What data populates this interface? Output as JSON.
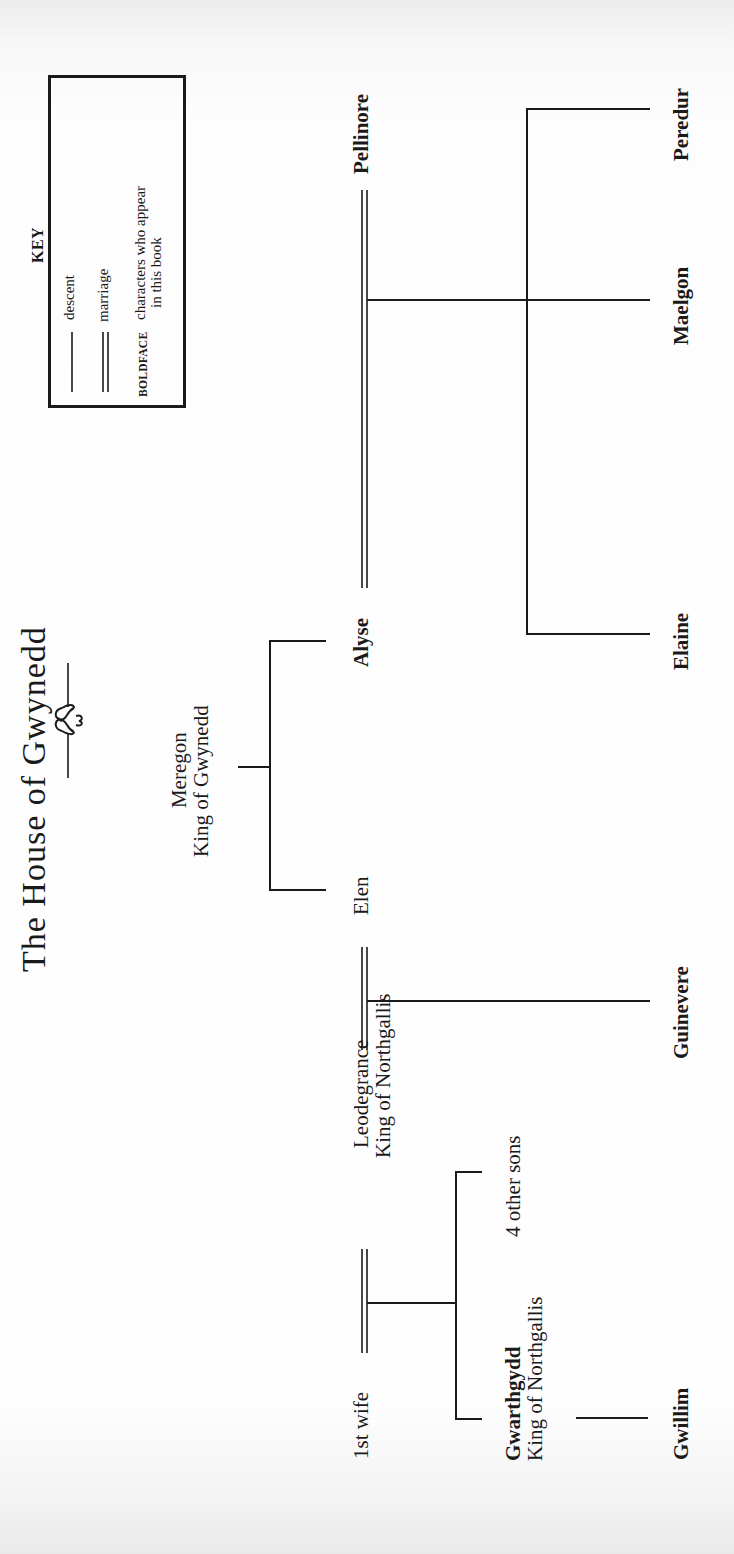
{
  "title": "The House of Gwynedd",
  "key": {
    "heading": "KEY",
    "entries": [
      {
        "symbol": "single-line",
        "label": "descent"
      },
      {
        "symbol": "double-line",
        "label": "marriage"
      },
      {
        "symbol": "BOLDFACE",
        "label_line1": "characters who appear",
        "label_line2": "in this book"
      }
    ]
  },
  "people": {
    "meregon": {
      "name": "Meregon",
      "title": "King of Gwynedd",
      "bold": false
    },
    "elen": {
      "name": "Elen",
      "bold": false
    },
    "alyse": {
      "name": "Alyse",
      "bold": true
    },
    "pellinore": {
      "name": "Pellinore",
      "bold": true
    },
    "leodegrance": {
      "name": "Leodegrance",
      "title": "King of Northgallis",
      "bold": false
    },
    "first_wife": {
      "name": "1st wife",
      "bold": false
    },
    "gwarthgydd": {
      "name": "Gwarthgydd",
      "title": "King of Northgallis",
      "bold": true
    },
    "other_sons": {
      "name": "4 other sons",
      "bold": false
    },
    "guinevere": {
      "name": "Guinevere",
      "bold": true
    },
    "elaine": {
      "name": "Elaine",
      "bold": true
    },
    "maelgon": {
      "name": "Maelgon",
      "bold": true
    },
    "peredur": {
      "name": "Peredur",
      "bold": true
    },
    "gwillim": {
      "name": "Gwillim",
      "bold": true
    }
  },
  "relationships": {
    "marriages": [
      [
        "Alyse",
        "Pellinore"
      ],
      [
        "Elen",
        "Leodegrance"
      ],
      [
        "1st wife",
        "Leodegrance"
      ]
    ],
    "descent": [
      {
        "parents": [
          "Meregon"
        ],
        "children": [
          "Elen",
          "Alyse"
        ]
      },
      {
        "parents": [
          "Alyse",
          "Pellinore"
        ],
        "children": [
          "Elaine",
          "Maelgon",
          "Peredur"
        ]
      },
      {
        "parents": [
          "Elen",
          "Leodegrance"
        ],
        "children": [
          "Guinevere"
        ]
      },
      {
        "parents": [
          "1st wife",
          "Leodegrance"
        ],
        "children": [
          "Gwarthgydd",
          "4 other sons"
        ]
      },
      {
        "parents": [
          "Gwarthgydd"
        ],
        "children": [
          "Gwillim"
        ]
      }
    ]
  },
  "colors": {
    "ink": "#1a1a1a",
    "paper": "#fefefe"
  }
}
